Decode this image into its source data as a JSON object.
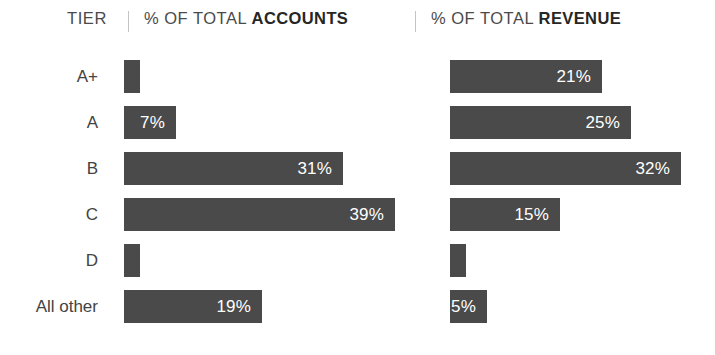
{
  "header": {
    "tier_label": "TIER",
    "accounts_prefix": "% OF TOTAL ",
    "accounts_strong": "ACCOUNTS",
    "revenue_prefix": "% OF TOTAL ",
    "revenue_strong": "REVENUE",
    "divider": "|"
  },
  "colors": {
    "bar_fill": "#4a4a4a",
    "bar_label": "#ffffff",
    "text": "#434343",
    "divider": "#c3c3c3",
    "background": "#ffffff"
  },
  "chart_data": {
    "type": "bar",
    "title": "",
    "xlabel": "",
    "ylabel": "TIER",
    "orientation": "horizontal",
    "grid": false,
    "legend": "none",
    "xlim": [
      0,
      40
    ],
    "categories": [
      "A+",
      "A",
      "B",
      "C",
      "D",
      "All other"
    ],
    "series": [
      {
        "name": "% OF TOTAL ACCOUNTS",
        "values": [
          2,
          7,
          31,
          39,
          2,
          19
        ],
        "labels": [
          "",
          "7%",
          "31%",
          "39%",
          "",
          "19%"
        ]
      },
      {
        "name": "% OF TOTAL REVENUE",
        "values": [
          21,
          25,
          32,
          15,
          2,
          5
        ],
        "labels": [
          "21%",
          "25%",
          "32%",
          "15%",
          "",
          "5%"
        ]
      }
    ]
  },
  "rows": [
    {
      "tier": "A+",
      "accounts_value": 2,
      "accounts_label": "",
      "accounts_width": "16px",
      "revenue_value": 21,
      "revenue_label": "21%",
      "revenue_width": "152px"
    },
    {
      "tier": "A",
      "accounts_value": 7,
      "accounts_label": "7%",
      "accounts_width": "52px",
      "revenue_value": 25,
      "revenue_label": "25%",
      "revenue_width": "181px"
    },
    {
      "tier": "B",
      "accounts_value": 31,
      "accounts_label": "31%",
      "accounts_width": "219px",
      "revenue_value": 32,
      "revenue_label": "32%",
      "revenue_width": "231px"
    },
    {
      "tier": "C",
      "accounts_value": 39,
      "accounts_label": "39%",
      "accounts_width": "271px",
      "revenue_value": 15,
      "revenue_label": "15%",
      "revenue_width": "110px"
    },
    {
      "tier": "D",
      "accounts_value": 2,
      "accounts_label": "",
      "accounts_width": "16px",
      "revenue_value": 2,
      "revenue_label": "",
      "revenue_width": "16px"
    },
    {
      "tier": "All other",
      "accounts_value": 19,
      "accounts_label": "19%",
      "accounts_width": "138px",
      "revenue_value": 5,
      "revenue_label": "5%",
      "revenue_width": "37px"
    }
  ]
}
